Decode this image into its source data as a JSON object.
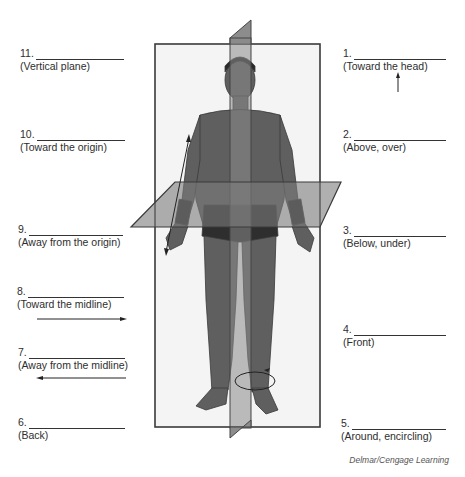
{
  "figure": {
    "credit": "Delmar/Cengage Learning"
  },
  "labels": {
    "left": [
      {
        "number": "11.",
        "hint": "(Vertical plane)"
      },
      {
        "number": "10.",
        "hint": "(Toward the origin)"
      },
      {
        "number": "9.",
        "hint": "(Away from the origin)"
      },
      {
        "number": "8.",
        "hint": "(Toward the midline)"
      },
      {
        "number": "7.",
        "hint": "(Away from the midline)"
      },
      {
        "number": "6.",
        "hint": "(Back)"
      }
    ],
    "right": [
      {
        "number": "1.",
        "hint": "(Toward the head)"
      },
      {
        "number": "2.",
        "hint": "(Above, over)"
      },
      {
        "number": "3.",
        "hint": "(Below, under)"
      },
      {
        "number": "4.",
        "hint": "(Front)"
      },
      {
        "number": "5.",
        "hint": "(Around, encircling)"
      }
    ]
  },
  "arrows": {
    "toward_head": "arrow-up",
    "toward_midline": "arrow-right",
    "away_from_midline": "arrow-left",
    "proximal_distal": "double-arrow-diagonal",
    "circumduction": "circular-arrow"
  },
  "colors": {
    "plane_fill": "#8a8a8a",
    "frame_stroke": "#3a3a3a",
    "body_fill": "#5e5e5e",
    "text": "#2e2e2e"
  }
}
